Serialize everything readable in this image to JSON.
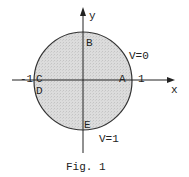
{
  "figure": {
    "caption": "Fig. 1",
    "axes": {
      "x_label": "x",
      "y_label": "y",
      "tick_neg": "-1",
      "tick_pos": "1"
    },
    "points": {
      "A": "A",
      "B": "B",
      "C": "C",
      "D": "D",
      "E": "E"
    },
    "boundary_labels": {
      "upper": "V=0",
      "lower": "V=1"
    },
    "colors": {
      "fill": "#d9d9d9",
      "stroke": "#333333",
      "axis": "#222222"
    }
  }
}
